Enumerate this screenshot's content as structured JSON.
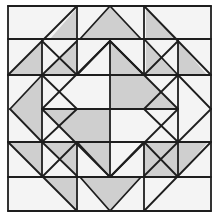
{
  "image": {
    "title": "Quilt block line drawing",
    "width": 218,
    "height": 218
  },
  "colors": {
    "background": "#ffffff",
    "fabric_light": "#f4f4f4",
    "fabric_shaded": "#cfcfcf",
    "line": "#1e1e1e"
  },
  "block": {
    "outer": [
      8,
      6,
      211,
      211
    ],
    "center_diamond": {
      "top": [
        110,
        41
      ],
      "right": [
        178,
        109
      ],
      "bottom": [
        110,
        177
      ],
      "left": [
        42,
        109
      ]
    }
  },
  "shaded_polygons": [
    [
      [
        110,
        6
      ],
      [
        80,
        39
      ],
      [
        141,
        39
      ]
    ],
    [
      [
        10,
        109
      ],
      [
        42,
        75
      ],
      [
        42,
        142
      ]
    ],
    [
      [
        110,
        211
      ],
      [
        80,
        177
      ],
      [
        141,
        177
      ]
    ],
    [
      [
        110,
        41
      ],
      [
        110,
        109
      ],
      [
        178,
        109
      ]
    ],
    [
      [
        42,
        109
      ],
      [
        110,
        109
      ],
      [
        110,
        177
      ]
    ],
    [
      [
        50,
        39
      ],
      [
        77,
        8
      ],
      [
        77,
        39
      ]
    ],
    [
      [
        8,
        75
      ],
      [
        42,
        41
      ],
      [
        42,
        75
      ]
    ],
    [
      [
        42,
        75
      ],
      [
        77,
        41
      ],
      [
        77,
        75
      ]
    ],
    [
      [
        146,
        7
      ],
      [
        146,
        39
      ],
      [
        178,
        39
      ]
    ],
    [
      [
        146,
        39
      ],
      [
        146,
        75
      ],
      [
        178,
        75
      ]
    ],
    [
      [
        178,
        41
      ],
      [
        178,
        75
      ],
      [
        207,
        75
      ]
    ],
    [
      [
        8,
        142
      ],
      [
        42,
        142
      ],
      [
        42,
        176
      ]
    ],
    [
      [
        42,
        142
      ],
      [
        77,
        142
      ],
      [
        77,
        176
      ]
    ],
    [
      [
        42,
        176
      ],
      [
        77,
        176
      ],
      [
        77,
        209
      ]
    ],
    [
      [
        143,
        142
      ],
      [
        178,
        142
      ],
      [
        143,
        176
      ]
    ],
    [
      [
        143,
        176
      ],
      [
        178,
        142
      ],
      [
        178,
        176
      ]
    ],
    [
      [
        178,
        142
      ],
      [
        208,
        142
      ],
      [
        178,
        176
      ]
    ]
  ],
  "lines": [
    [
      8,
      6,
      211,
      6
    ],
    [
      211,
      6,
      211,
      211
    ],
    [
      211,
      211,
      8,
      211
    ],
    [
      8,
      211,
      8,
      6
    ],
    [
      77,
      6,
      77,
      75
    ],
    [
      144,
      6,
      144,
      75
    ],
    [
      8,
      39,
      211,
      39
    ],
    [
      8,
      75,
      211,
      75
    ],
    [
      8,
      142,
      211,
      142
    ],
    [
      8,
      177,
      211,
      177
    ],
    [
      42,
      39,
      42,
      177
    ],
    [
      178,
      39,
      178,
      177
    ],
    [
      110,
      41,
      110,
      177
    ],
    [
      42,
      109,
      178,
      109
    ],
    [
      77,
      142,
      77,
      211
    ],
    [
      144,
      142,
      144,
      211
    ],
    [
      110,
      41,
      178,
      109
    ],
    [
      178,
      109,
      110,
      177
    ],
    [
      110,
      177,
      42,
      109
    ],
    [
      42,
      109,
      110,
      41
    ],
    [
      8,
      75,
      77,
      6
    ],
    [
      42,
      75,
      77,
      41
    ],
    [
      144,
      6,
      211,
      75
    ],
    [
      144,
      39,
      178,
      75
    ],
    [
      8,
      142,
      77,
      211
    ],
    [
      42,
      142,
      77,
      176
    ],
    [
      211,
      142,
      144,
      211
    ],
    [
      178,
      142,
      144,
      176
    ],
    [
      80,
      39,
      110,
      6
    ],
    [
      110,
      6,
      141,
      39
    ],
    [
      42,
      75,
      10,
      109
    ],
    [
      10,
      109,
      42,
      142
    ],
    [
      80,
      177,
      110,
      211
    ],
    [
      110,
      211,
      141,
      177
    ],
    [
      178,
      75,
      211,
      109
    ],
    [
      211,
      109,
      178,
      142
    ],
    [
      42,
      41,
      77,
      75
    ],
    [
      144,
      75,
      178,
      41
    ],
    [
      42,
      177,
      77,
      142
    ],
    [
      144,
      142,
      178,
      177
    ],
    [
      77,
      75,
      110,
      41
    ],
    [
      110,
      41,
      144,
      75
    ],
    [
      77,
      142,
      110,
      177
    ],
    [
      110,
      177,
      144,
      142
    ],
    [
      42,
      75,
      77,
      109
    ],
    [
      42,
      142,
      77,
      109
    ],
    [
      178,
      75,
      144,
      109
    ],
    [
      178,
      142,
      144,
      109
    ]
  ]
}
